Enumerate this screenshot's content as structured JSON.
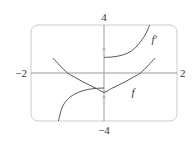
{
  "chart_data": {
    "type": "line",
    "title": "",
    "xlabel": "",
    "ylabel": "",
    "xlim": [
      -2,
      2
    ],
    "ylim": [
      -4,
      4
    ],
    "tick_labels": {
      "x_min": "−2",
      "x_max": "2",
      "y_max": "4",
      "y_min": "−4"
    },
    "y_ticks": [
      2,
      -2
    ],
    "grid": false,
    "legend": null,
    "series": [
      {
        "name": "f",
        "label": "f",
        "x": [
          -1.4,
          -1.2,
          -1.0,
          -0.8,
          -0.6,
          -0.4,
          -0.2,
          0.0,
          0.2,
          0.4,
          0.6,
          0.8,
          1.0,
          1.2,
          1.4
        ],
        "y": [
          1.25,
          0.6,
          0.0,
          -0.35,
          -0.7,
          -1.0,
          -1.3,
          -1.6,
          -1.3,
          -1.0,
          -0.7,
          -0.35,
          0.0,
          0.6,
          1.25
        ]
      },
      {
        "name": "f'",
        "label": "f′",
        "branches": [
          {
            "x": [
              -1.25,
              -1.15,
              -1.0,
              -0.8,
              -0.6,
              -0.4,
              -0.2,
              0.0
            ],
            "y": [
              -4.0,
              -2.9,
              -2.2,
              -1.75,
              -1.5,
              -1.35,
              -1.28,
              -1.25
            ]
          },
          {
            "x": [
              0.0,
              0.2,
              0.4,
              0.6,
              0.8,
              1.0,
              1.15,
              1.25
            ],
            "y": [
              1.3,
              1.33,
              1.42,
              1.6,
              1.95,
              2.6,
              3.3,
              4.0
            ]
          }
        ]
      }
    ],
    "annotations": [
      {
        "text": "f′",
        "x": 1.3,
        "y": 2.8
      },
      {
        "text": "f",
        "x": 0.75,
        "y": -1.6
      }
    ]
  },
  "colors": {
    "frame": "#cccccc",
    "axis": "#999999",
    "curve": "#555555",
    "text": "#333333"
  }
}
